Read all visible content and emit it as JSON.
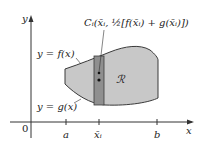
{
  "diagram": {
    "axes": {
      "x_label": "x",
      "y_label": "y",
      "origin": "0"
    },
    "ticks": {
      "a": "a",
      "xi": "x̄ᵢ",
      "b": "b"
    },
    "curves": {
      "top": "y = f(x)",
      "bottom": "y = g(x)"
    },
    "region_label": "ℛ",
    "centroid_label": "Cᵢ(x̄ᵢ, ½[f(x̄ᵢ) + g(x̄ᵢ)])",
    "colors": {
      "region": "#c8c8c8",
      "strip": "#8f8f8f",
      "outline": "#3a3a3a"
    }
  }
}
